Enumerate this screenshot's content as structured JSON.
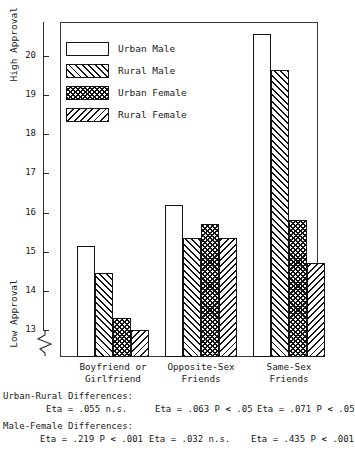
{
  "chart_data": {
    "type": "bar",
    "title": "",
    "xlabel": "",
    "ylabel": "Approval",
    "ylim": [
      12.75,
      20.8
    ],
    "grid": false,
    "legend_position": "upper-left-inside",
    "axis_break": true,
    "axis_break_note": "y-axis broken below 13",
    "categories": [
      "Boyfriend or Girlfriend",
      "Opposite-Sex Friends",
      "Same-Sex Friends"
    ],
    "yticks": [
      13,
      14,
      15,
      16,
      17,
      18,
      19,
      20
    ],
    "ytick_labels": [
      "13",
      "14",
      "15",
      "16",
      "17",
      "18",
      "19",
      "20"
    ],
    "axis_top_label": "High Approval",
    "axis_bottom_label": "Low Approval",
    "series": [
      {
        "name": "Urban Male",
        "pattern": "solid-white",
        "values": [
          15.15,
          16.2,
          20.55
        ]
      },
      {
        "name": "Rural Male",
        "pattern": "diagonal-up",
        "values": [
          14.45,
          15.35,
          19.65
        ]
      },
      {
        "name": "Urban Female",
        "pattern": "cross-hatch",
        "values": [
          13.3,
          15.7,
          15.8
        ]
      },
      {
        "name": "Rural Female",
        "pattern": "diagonal-down",
        "values": [
          13.0,
          15.35,
          14.7
        ]
      }
    ]
  },
  "legend": {
    "items": [
      {
        "label": "Urban Male"
      },
      {
        "label": "Rural Male"
      },
      {
        "label": "Urban Female"
      },
      {
        "label": "Rural Female"
      }
    ]
  },
  "categories": [
    {
      "line1": "Boyfriend or",
      "line2": "Girlfriend"
    },
    {
      "line1": "Opposite-Sex",
      "line2": "Friends"
    },
    {
      "line1": "Same-Sex",
      "line2": "Friends"
    }
  ],
  "yaxis": {
    "high_label": "High Approval",
    "low_label": "Low Approval",
    "ticks": [
      "20",
      "19",
      "18",
      "17",
      "16",
      "15",
      "14",
      "13"
    ]
  },
  "stats": {
    "urban_rural_heading": "Urban-Rural Differences:",
    "urban_rural_values": [
      "Eta = .055 n.s.",
      "Eta = .063 P < .05",
      "Eta = .071 P < .05"
    ],
    "male_female_heading": "Male-Female Differences:",
    "male_female_values": [
      "Eta = .219 P < .001",
      "Eta = .032 n.s.",
      "Eta = .435 P < .001"
    ]
  }
}
